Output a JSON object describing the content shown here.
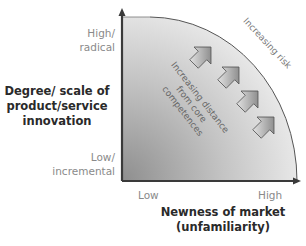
{
  "diagram": {
    "y_axis": {
      "title": "Degree/scale of product/service innovation",
      "title_lines": [
        "Degree/ scale of",
        "product/service",
        "innovation"
      ],
      "high_label_lines": [
        "High/",
        "radical"
      ],
      "low_label_lines": [
        "Low/",
        "incremental"
      ]
    },
    "x_axis": {
      "title_lines": [
        "Newness of market",
        "(unfamiliarity)"
      ],
      "low_label": "Low",
      "high_label": "High"
    },
    "annotations": {
      "risk": "Increasing risk",
      "distance_lines": [
        "Increasing distance",
        "from core",
        "competences"
      ]
    },
    "arrows": [
      {
        "name": "arrow-1"
      },
      {
        "name": "arrow-2"
      },
      {
        "name": "arrow-3"
      },
      {
        "name": "arrow-4"
      }
    ],
    "colors": {
      "fill_dark": "#8c8c8c",
      "fill_light": "#e6e6e6",
      "axis": "#3a3a3a",
      "arc": "#555555"
    }
  }
}
